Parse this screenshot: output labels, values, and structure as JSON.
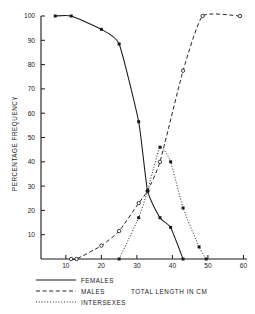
{
  "chart_data": {
    "type": "line",
    "title": "",
    "xlabel": "TOTAL LENGTH IN CM",
    "ylabel": "PERCENTAGE FREQUENCY",
    "xlim": [
      3,
      61
    ],
    "ylim": [
      0,
      100
    ],
    "xticks": [
      10,
      20,
      30,
      40,
      50,
      60
    ],
    "yticks": [
      10,
      20,
      30,
      40,
      50,
      60,
      70,
      80,
      90,
      100
    ],
    "grid": false,
    "legend_position": "bottom-left",
    "series": [
      {
        "name": "FEMALES",
        "style": "solid",
        "marker": "filled-square",
        "points": [
          {
            "x": 7.0,
            "y": 100
          },
          {
            "x": 11.5,
            "y": 100
          },
          {
            "x": 20.0,
            "y": 94.5
          },
          {
            "x": 25.0,
            "y": 88.5
          },
          {
            "x": 30.5,
            "y": 56.5
          },
          {
            "x": 33.0,
            "y": 28.0
          },
          {
            "x": 36.5,
            "y": 17.0
          },
          {
            "x": 39.5,
            "y": 13.0
          },
          {
            "x": 43.0,
            "y": 0
          }
        ]
      },
      {
        "name": "MALES",
        "style": "dashed",
        "marker": "open-circle",
        "points": [
          {
            "x": 11.5,
            "y": 0
          },
          {
            "x": 13.0,
            "y": 0
          },
          {
            "x": 20.0,
            "y": 5.5
          },
          {
            "x": 25.0,
            "y": 11.5
          },
          {
            "x": 30.5,
            "y": 23.0
          },
          {
            "x": 33.0,
            "y": 28.0
          },
          {
            "x": 36.5,
            "y": 40.0
          },
          {
            "x": 43.0,
            "y": 77.5
          },
          {
            "x": 48.5,
            "y": 100
          },
          {
            "x": 59.0,
            "y": 100
          }
        ]
      },
      {
        "name": "INTERSEXES",
        "style": "dotted",
        "marker": "filled-square",
        "points": [
          {
            "x": 25.0,
            "y": 0
          },
          {
            "x": 30.5,
            "y": 17.0
          },
          {
            "x": 33.0,
            "y": 28.0
          },
          {
            "x": 36.5,
            "y": 46.0
          },
          {
            "x": 39.5,
            "y": 40.0
          },
          {
            "x": 43.0,
            "y": 21.0
          },
          {
            "x": 47.5,
            "y": 5.0
          },
          {
            "x": 49.5,
            "y": 0
          }
        ]
      }
    ]
  },
  "legend": {
    "items": [
      {
        "label": "FEMALES",
        "style": "solid"
      },
      {
        "label": "MALES",
        "style": "dashed"
      },
      {
        "label": "INTERSEXES",
        "style": "dotted"
      }
    ]
  },
  "colors": {
    "ink": "#1a1a1a",
    "background": "#ffffff"
  }
}
